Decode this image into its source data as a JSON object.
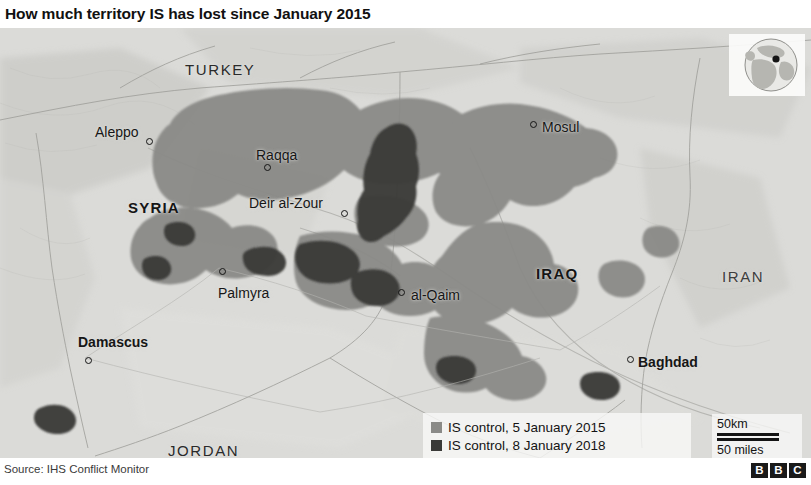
{
  "title": "How much territory IS has lost since January 2015",
  "footer": {
    "source": "Source: IHS Conflict Monitor",
    "logo_letters": [
      "B",
      "B",
      "C"
    ]
  },
  "legend": {
    "items": [
      {
        "label": "IS control, 5 January 2015",
        "color": "#8a8a87"
      },
      {
        "label": "IS control, 8 January 2018",
        "color": "#3a3a38"
      }
    ]
  },
  "scale": {
    "km": "50km",
    "miles": "50 miles"
  },
  "map": {
    "background_color": "#d8d8d6",
    "territory_2015_color": "#8a8a87",
    "territory_2018_color": "#3a3a38",
    "countries": [
      {
        "name": "TURKEY",
        "x": 185,
        "y": 34,
        "style": "regular"
      },
      {
        "name": "SYRIA",
        "x": 128,
        "y": 172,
        "style": "bold"
      },
      {
        "name": "IRAQ",
        "x": 536,
        "y": 238,
        "style": "bold"
      },
      {
        "name": "IRAN",
        "x": 722,
        "y": 241,
        "style": "faint"
      },
      {
        "name": "JORDAN",
        "x": 168,
        "y": 415,
        "style": "regular"
      }
    ],
    "cities": [
      {
        "name": "Aleppo",
        "label_x": 95,
        "label_y": 97,
        "dot_x": 146,
        "dot_y": 110,
        "capital": false
      },
      {
        "name": "Raqqa",
        "label_x": 256,
        "label_y": 120,
        "dot_x": 264,
        "dot_y": 136,
        "capital": false
      },
      {
        "name": "Deir al-Zour",
        "label_x": 249,
        "label_y": 168,
        "dot_x": 341,
        "dot_y": 182,
        "capital": false
      },
      {
        "name": "Mosul",
        "label_x": 542,
        "label_y": 92,
        "dot_x": 530,
        "dot_y": 93,
        "capital": false
      },
      {
        "name": "Palmyra",
        "label_x": 218,
        "label_y": 258,
        "dot_x": 219,
        "dot_y": 240,
        "capital": false
      },
      {
        "name": "al-Qaim",
        "label_x": 411,
        "label_y": 260,
        "dot_x": 398,
        "dot_y": 261,
        "capital": false
      },
      {
        "name": "Damascus",
        "label_x": 78,
        "label_y": 307,
        "dot_x": 85,
        "dot_y": 329,
        "capital": true
      },
      {
        "name": "Baghdad",
        "label_x": 638,
        "label_y": 327,
        "dot_x": 627,
        "dot_y": 328,
        "capital": true
      }
    ],
    "inset": {
      "type": "globe-locator",
      "marker": "region-marker"
    }
  }
}
